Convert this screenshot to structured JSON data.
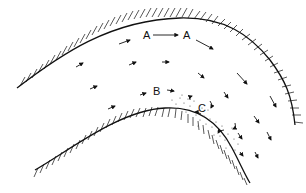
{
  "diagram": {
    "type": "river-meander-flow",
    "labels": [
      {
        "id": "A1",
        "text": "A",
        "x": 143,
        "y": 39
      },
      {
        "id": "A2",
        "text": "A",
        "x": 186,
        "y": 39
      },
      {
        "id": "B",
        "text": "B",
        "x": 153,
        "y": 93
      },
      {
        "id": "C",
        "text": "C",
        "x": 198,
        "y": 110
      }
    ],
    "colors": {
      "ink": "#111111",
      "background": "#ffffff",
      "stipple": "#555555"
    }
  }
}
